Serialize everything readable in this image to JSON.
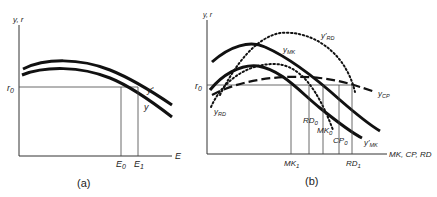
{
  "panel_a": {
    "caption": "(a)",
    "y_axis_label": "y, r",
    "x_axis_label": "E",
    "r_label": "r",
    "r_sub": "0",
    "curve_labels": {
      "y_prime": "y'",
      "y": "y"
    },
    "ticks": [
      {
        "main": "E",
        "sub": "0"
      },
      {
        "main": "E",
        "sub": "1"
      }
    ]
  },
  "panel_b": {
    "caption": "(b)",
    "y_axis_label": "y, r",
    "x_axis_label": "MK, CP, RD",
    "r_label": "r",
    "r_sub": "0",
    "curve_labels": {
      "y_mk": {
        "main": "y",
        "sub": "MK"
      },
      "y_mk_prime": {
        "main": "y'",
        "sub": "MK"
      },
      "y_rd": {
        "main": "y",
        "sub": "RD"
      },
      "y_rd_prime": {
        "main": "y'",
        "sub": "RD"
      },
      "y_cp": {
        "main": "y",
        "sub": "CP"
      }
    },
    "ticks": [
      {
        "main": "MK",
        "sub": "1"
      },
      {
        "main": "RD",
        "sub": "0"
      },
      {
        "main": "MK",
        "sub": "0"
      },
      {
        "main": "CP",
        "sub": "0"
      },
      {
        "main": "RD",
        "sub": "1"
      }
    ]
  }
}
